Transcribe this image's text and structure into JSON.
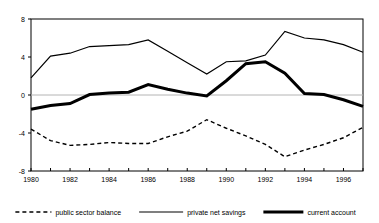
{
  "chart_data": {
    "type": "line",
    "title": "",
    "xlabel": "",
    "ylabel": "",
    "x": [
      1980,
      1981,
      1982,
      1983,
      1984,
      1985,
      1986,
      1987,
      1988,
      1989,
      1990,
      1991,
      1992,
      1993,
      1994,
      1995,
      1996,
      1997
    ],
    "xlim": [
      1980,
      1997
    ],
    "ylim": [
      -8,
      8
    ],
    "yticks": [
      8,
      4,
      0,
      -4,
      -8
    ],
    "ytick_labels": [
      "8",
      "4",
      "0",
      "-4",
      "-8"
    ],
    "xticks": [
      1980,
      1982,
      1984,
      1986,
      1988,
      1990,
      1992,
      1994,
      1996
    ],
    "xtick_labels": [
      "1980",
      "1982",
      "1984",
      "1986",
      "1988",
      "1990",
      "1992",
      "1994",
      "1996"
    ],
    "xminor_ticks": [
      1981,
      1983,
      1985,
      1987,
      1989,
      1991,
      1993,
      1995,
      1997
    ],
    "grid": false,
    "zero_line": true,
    "legend_position": "bottom",
    "series": [
      {
        "name": "public sector balance",
        "style": "dashed",
        "color": "#000000",
        "width": 1.4,
        "values": [
          -3.6,
          -4.8,
          -5.3,
          -5.2,
          -5.0,
          -5.1,
          -5.1,
          -4.4,
          -3.8,
          -2.6,
          -3.5,
          -4.3,
          -5.2,
          -6.5,
          -5.8,
          -5.2,
          -4.5,
          -3.4
        ]
      },
      {
        "name": "private net savings",
        "style": "solid-thin",
        "color": "#000000",
        "width": 1.2,
        "values": [
          1.8,
          4.1,
          4.4,
          5.1,
          5.2,
          5.3,
          5.8,
          4.6,
          3.4,
          2.2,
          3.5,
          3.6,
          4.2,
          6.7,
          6.0,
          5.8,
          5.3,
          4.5
        ]
      },
      {
        "name": "current account",
        "style": "solid-thick",
        "color": "#000000",
        "width": 3.0,
        "values": [
          -1.5,
          -1.1,
          -0.9,
          0.05,
          0.2,
          0.3,
          1.1,
          0.6,
          0.2,
          -0.1,
          1.5,
          3.3,
          3.5,
          2.3,
          0.15,
          0.05,
          -0.5,
          -1.2
        ]
      }
    ]
  },
  "legend": {
    "items": [
      {
        "label": "public sector balance",
        "style": "dashed"
      },
      {
        "label": "private net savings",
        "style": "solid-thin"
      },
      {
        "label": "current account",
        "style": "solid-thick"
      }
    ]
  },
  "colors": {
    "axis": "#000000",
    "zero_line": "#b4b4b4",
    "background": "#ffffff",
    "line": "#000000"
  }
}
